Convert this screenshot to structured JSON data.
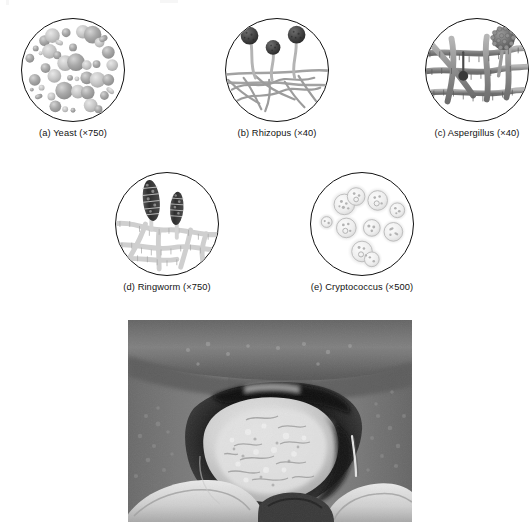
{
  "figure": {
    "panels": [
      {
        "id": "yeast",
        "label": "(a) Yeast (×750)",
        "organism": "Yeast",
        "magnification": "×750",
        "letter": "a",
        "illustration": "budding-yeast-cells",
        "description": "Round and oval budding yeast cells of varying size scattered across the field"
      },
      {
        "id": "rhizopus",
        "label": "(b) Rhizopus (×40)",
        "organism": "Rhizopus",
        "magnification": "×40",
        "letter": "b",
        "illustration": "sporangia-on-sporangiophores",
        "description": "Three dark round sporangia on curved stalks arising from a mat of non-septate hyphae"
      },
      {
        "id": "aspergillus",
        "label": "(c) Aspergillus (×40)",
        "organism": "Aspergillus",
        "magnification": "×40",
        "letter": "c",
        "illustration": "conidial-head-on-septate-hyphae",
        "description": "Septate branching hyphae with a textured conidial head and a small dark immature head"
      },
      {
        "id": "ringworm",
        "label": "(d) Ringworm (×750)",
        "organism": "Ringworm",
        "magnification": "×750",
        "letter": "d",
        "illustration": "macroconidia-on-hyphae",
        "description": "Two dark spindle-shaped multicellular macroconidia borne on pale septate hyphae"
      },
      {
        "id": "cryptococcus",
        "label": "(e) Cryptococcus (×500)",
        "organism": "Cryptococcus",
        "magnification": "×500",
        "letter": "e",
        "illustration": "encapsulated-budding-yeast",
        "description": "Pale budding yeast cells surrounded by wide clear capsules with granular inclusions"
      }
    ],
    "photograph": {
      "id": "oral-thrush-photo",
      "subject": "Oral candidiasis of the tongue",
      "description": "Black and white clinical photograph of an open mouth showing a thick white plaque coating the dorsum of the tongue, framed by the lips and gloved fingers",
      "tone": "grayscale"
    }
  },
  "colors": {
    "ink": "#111111",
    "label_text": "#121212",
    "page_background": "#ffffff",
    "yeast_cell": "#9a9a9a",
    "yeast_cell_light": "#c9c9c9",
    "hypha_gray": "#8d8d8d",
    "hypha_light": "#c4c4c4",
    "spore_dark": "#3b3b3b",
    "capsule_halo": "#e2e2e2",
    "photo_mid": "#7a7a7a",
    "photo_dark": "#1c1c1c",
    "photo_light": "#efefef"
  }
}
